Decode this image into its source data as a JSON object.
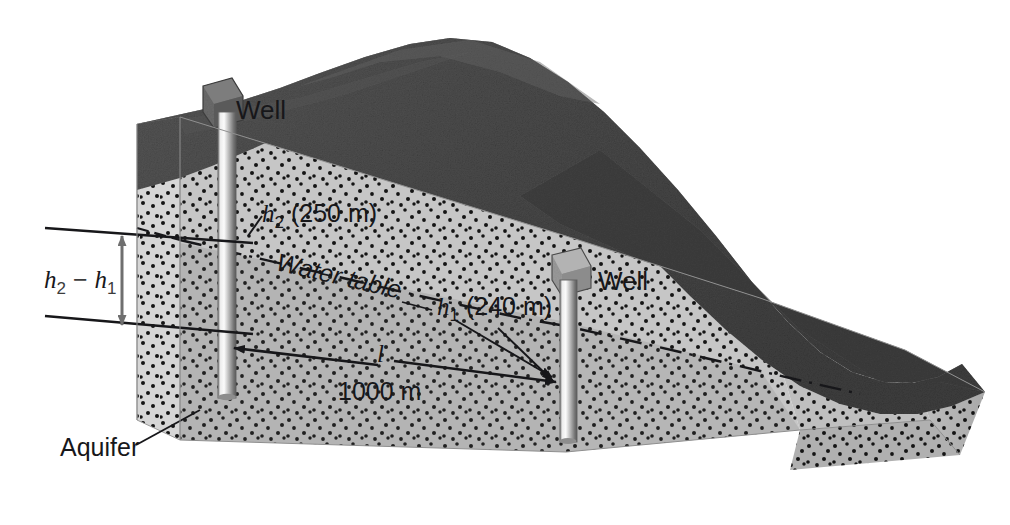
{
  "figure": {
    "domain": "geology-diagram",
    "width": 1010,
    "height": 525
  },
  "labels": {
    "well_left": "Well",
    "well_right": "Well",
    "h2": "h",
    "h2_sub": "2",
    "h2_value": "(250 m)",
    "h1": "h",
    "h1_sub": "1",
    "h1_value": "(240 m)",
    "water_table": "Water table",
    "head_difference": "h",
    "head_difference_sub2": "2",
    "head_difference_minus": " − ",
    "head_difference_sub1": "1",
    "length_symbol": "l",
    "length_value": "1000 m",
    "aquifer": "Aquifer"
  },
  "values": {
    "h2_meters": 250,
    "h1_meters": 240,
    "separation_meters": 1000,
    "head_difference_meters": 10
  },
  "colors": {
    "terrain_dark": "#4a4a4a",
    "terrain_dark_shadow": "#3a3a3a",
    "aquifer_light": "#c9c9c9",
    "aquifer_face": "#bdbdbd",
    "aquifer_side": "#d2d2d2",
    "aquifer_end": "#b5b5b5",
    "speckle": "#141414",
    "well_light": "#f2f2f2",
    "well_dark": "#6e6e6e",
    "line": "#17171a",
    "arrow_gray": "#6f6f6f",
    "background": "#ffffff"
  },
  "elements": {
    "well_left_name": "left-well-casing",
    "well_right_name": "right-well-casing",
    "water_table_name": "water-table-line",
    "terrain_name": "hill-terrain",
    "aquifer_name": "aquifer-body"
  }
}
